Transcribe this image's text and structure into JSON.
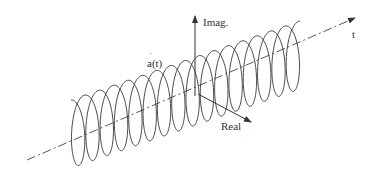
{
  "figure": {
    "labels": {
      "imag_axis": "Imag.",
      "time_axis": "t",
      "signal": "a(t)",
      "signal_dot": "˙",
      "real_axis": "Real"
    },
    "helix": {
      "turns": 16,
      "start": [
        71,
        134
      ],
      "end": [
        300,
        55
      ],
      "radius_y": 34,
      "radius_x": 10
    },
    "colors": {
      "line": "#333333",
      "background": "#ffffff"
    }
  }
}
